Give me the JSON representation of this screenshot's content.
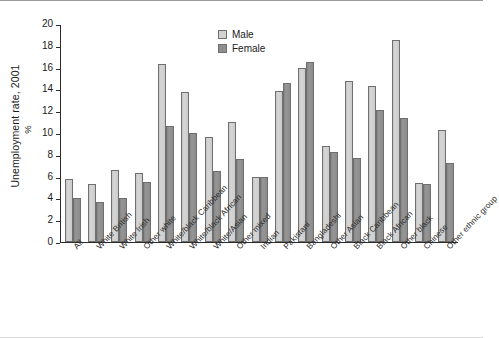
{
  "chart_data": {
    "type": "bar",
    "title": "",
    "subtitle": "",
    "xlabel": "",
    "ylabel": "Unemployment rate, 2001",
    "yunit": "%",
    "ylim": [
      0,
      20
    ],
    "ytick_step": 2,
    "yticks": [
      "20",
      "18",
      "16",
      "14",
      "12",
      "10",
      "8",
      "6",
      "4",
      "2",
      "0"
    ],
    "grid": false,
    "legend_position": "top-center",
    "categories": [
      "All",
      "White British",
      "White Irish",
      "Other white",
      "White/black Caribbean",
      "White/black African",
      "White/Asian",
      "Other mixed",
      "Indian",
      "Pakistani",
      "Bangladeshi",
      "Other Asian",
      "Black Caribbean",
      "Black African",
      "Other black",
      "Chinese",
      "Other ethnic group"
    ],
    "series": [
      {
        "name": "Male",
        "color": "#d2d2d2",
        "values": [
          5.8,
          5.3,
          6.6,
          6.3,
          16.3,
          13.8,
          9.6,
          11.0,
          6.0,
          13.9,
          16.0,
          8.8,
          14.8,
          14.3,
          18.5,
          5.4,
          10.3
        ]
      },
      {
        "name": "Female",
        "color": "#8e8e8e",
        "values": [
          4.0,
          3.65,
          4.0,
          5.5,
          10.6,
          10.0,
          6.55,
          7.6,
          6.0,
          14.6,
          16.5,
          8.25,
          7.75,
          12.1,
          11.4,
          5.3,
          7.25
        ]
      }
    ]
  },
  "legend": {
    "items": [
      {
        "label": "Male"
      },
      {
        "label": "Female"
      }
    ]
  }
}
